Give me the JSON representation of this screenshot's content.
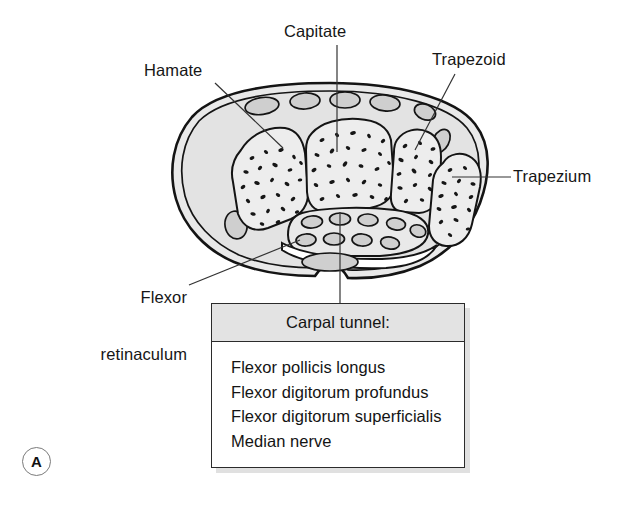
{
  "figure": {
    "panel_letter": "A",
    "background_color": "#ffffff",
    "ink_color": "#1a1a1a"
  },
  "labels": [
    {
      "id": "capitate",
      "text": "Capitate",
      "name": "label-capitate"
    },
    {
      "id": "hamate",
      "text": "Hamate",
      "name": "label-hamate"
    },
    {
      "id": "trapezoid",
      "text": "Trapezoid",
      "name": "label-trapezoid"
    },
    {
      "id": "trapezium",
      "text": "Trapezium",
      "name": "label-trapezium"
    },
    {
      "id": "flexor_retinaculum",
      "text_line1": "Flexor",
      "text_line2": "retinaculum",
      "name": "label-flexor-retinaculum"
    }
  ],
  "info_box": {
    "title": "Carpal tunnel:",
    "header_color": "#e3e3e3",
    "border_color": "#2b2b2b",
    "items": [
      "Flexor pollicis longus",
      "Flexor digitorum profundus",
      "Flexor digitorum superficialis",
      "Median nerve"
    ]
  },
  "diagram": {
    "type": "anatomical-cross-section",
    "bone_fill": "#ececec",
    "soft_tissue_fill": "#e6e6e6",
    "tendon_fill": "#d8d8d8",
    "outline_color": "#141414",
    "bones": [
      "Hamate",
      "Capitate",
      "Trapezoid",
      "Trapezium"
    ],
    "leader_lines": 5
  }
}
